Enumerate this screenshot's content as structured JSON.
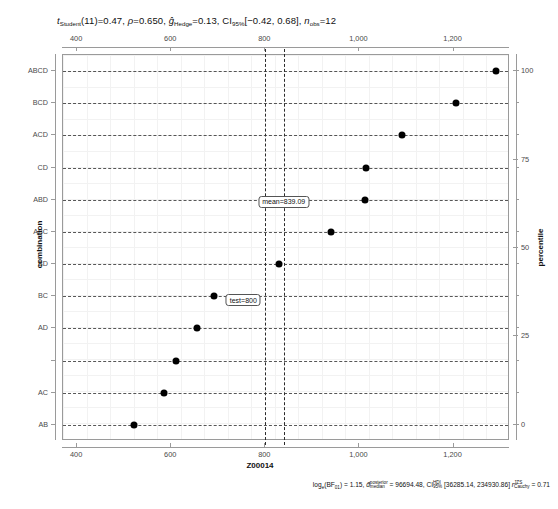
{
  "title": {
    "t_stat_label": "t",
    "t_stat_sub": "Student",
    "t_stat_value": "(11)=0.47",
    "rho_label": "ρ",
    "rho_value": "=0.650",
    "g_label": "ĝ",
    "g_sub": "Hedge",
    "g_value": "=0.13",
    "ci_label": "CI",
    "ci_sub": "95%",
    "ci_value": "[−0.42, 0.68]",
    "n_label": "n",
    "n_sub": "obs",
    "n_value": "=12",
    "full": "t_Student(11)=0.47, ρ=0.650, ĝ_Hedge=0.13, CI_95%[−0.42, 0.68], n_obs=12"
  },
  "caption": {
    "bf_label": "log",
    "bf_sub": "e",
    "bf_paren_open": "(BF",
    "bf_paren_sub": "01",
    "bf_paren_close": ")",
    "bf_value": " = 1.15, ",
    "d_label": "d̂",
    "d_sup": "posterior",
    "d_sub": "median",
    "d_value": " = 96694.48, ",
    "ci_label": "CI",
    "ci_sup": "HDI",
    "ci_sub": "95%",
    "ci_value": " [36285.14, 234930.86] ",
    "r_label": "r",
    "r_sup": "JZS",
    "r_sub": "Cauchy",
    "r_value": " = 0.71",
    "full": "log_e(BF01) = 1.15, d̂_median^posterior = 96694.48, CI_95%^HDI [36285.14, 234930.86] r^JZS_Cauchy = 0.71"
  },
  "chart_data": {
    "type": "scatter",
    "xlabel": "Z00014",
    "ylabel": "combination",
    "y2label": "percentile",
    "xlim": [
      370,
      1320
    ],
    "xticks": [
      400,
      600,
      800,
      1000,
      1200
    ],
    "xticklabels": [
      "400",
      "600",
      "800",
      "1,000",
      "1,200"
    ],
    "y2ticks": [
      0,
      25,
      50,
      75,
      100
    ],
    "y2ticklabels": [
      "0",
      "25",
      "50",
      "75",
      "100"
    ],
    "grid": true,
    "legend": false,
    "categories": [
      "ABCD",
      "BCD",
      "ACD",
      "CD",
      "ABD",
      "ABC",
      "BD",
      "BC",
      "AD",
      "",
      "AC",
      "AB"
    ],
    "values": [
      1290,
      1205,
      1090,
      1015,
      1012,
      940,
      830,
      690,
      655,
      610,
      585,
      520
    ],
    "points": [
      {
        "label": "ABCD",
        "value": 1290,
        "percentile": 100
      },
      {
        "label": "BCD",
        "value": 1205,
        "percentile": 91
      },
      {
        "label": "ACD",
        "value": 1090,
        "percentile": 82
      },
      {
        "label": "CD",
        "value": 1015,
        "percentile": 73
      },
      {
        "label": "ABD",
        "value": 1012,
        "percentile": 64
      },
      {
        "label": "ABC",
        "value": 940,
        "percentile": 55
      },
      {
        "label": "BD",
        "value": 830,
        "percentile": 45
      },
      {
        "label": "BC",
        "value": 690,
        "percentile": 36
      },
      {
        "label": "AD",
        "value": 655,
        "percentile": 27
      },
      {
        "label": "",
        "value": 610,
        "percentile": 18
      },
      {
        "label": "AC",
        "value": 585,
        "percentile": 9
      },
      {
        "label": "AB",
        "value": 520,
        "percentile": 0
      }
    ],
    "reference_lines": [
      {
        "name": "test",
        "value": 800,
        "annotation": "test=800"
      },
      {
        "name": "mean",
        "value": 839.09,
        "annotation": "mean=839.09"
      }
    ]
  },
  "annotations": {
    "mean_label": "mean=839.09",
    "test_label": "test=800"
  },
  "axes": {
    "x_title": "Z00014",
    "y_title": "combination",
    "y2_title": "percentile"
  }
}
